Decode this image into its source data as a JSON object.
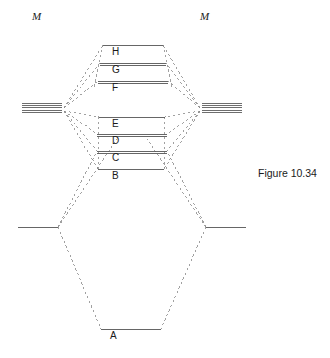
{
  "figure": {
    "caption": "Figure 10.34",
    "caption_x": 258,
    "caption_y": 167,
    "width": 330,
    "height": 358,
    "background_color": "#ffffff",
    "line_color": "#555555",
    "dash_color": "#8a8a8a",
    "text_color": "#1a1a1a"
  },
  "atoms": {
    "left": {
      "label": "M",
      "label_x": 32,
      "label_y": 10,
      "ao_bundle": {
        "x_start": 22,
        "x_end": 62,
        "y_top": 103,
        "line_count": 5,
        "line_spacing": 2.4
      },
      "ligand_level": {
        "x_start": 18,
        "x_end": 58,
        "y": 227
      }
    },
    "right": {
      "label": "M",
      "label_x": 200,
      "label_y": 10,
      "ao_bundle": {
        "x_start": 202,
        "x_end": 242,
        "y_top": 103,
        "line_count": 5,
        "line_spacing": 2.4
      },
      "ligand_level": {
        "x_start": 206,
        "x_end": 246,
        "y": 227
      }
    }
  },
  "molecular_orbitals": [
    {
      "id": "H",
      "label": "H",
      "y": 45,
      "x_start": 103,
      "x_end": 163,
      "lines": 1,
      "label_x": 112,
      "label_y": 47
    },
    {
      "id": "G",
      "label": "G",
      "y": 63,
      "x_start": 100,
      "x_end": 166,
      "lines": 2,
      "label_x": 112,
      "label_y": 65
    },
    {
      "id": "F",
      "label": "F",
      "y": 81,
      "x_start": 98,
      "x_end": 168,
      "lines": 2,
      "label_x": 112,
      "label_y": 83
    },
    {
      "id": "E",
      "label": "E",
      "y": 117,
      "x_start": 99,
      "x_end": 165,
      "lines": 1,
      "label_x": 112,
      "label_y": 119
    },
    {
      "id": "D",
      "label": "D",
      "y": 134,
      "x_start": 97,
      "x_end": 167,
      "lines": 2,
      "label_x": 112,
      "label_y": 136
    },
    {
      "id": "C",
      "label": "C",
      "y": 151,
      "x_start": 97,
      "x_end": 167,
      "lines": 2,
      "label_x": 112,
      "label_y": 153
    },
    {
      "id": "B",
      "label": "B",
      "y": 169,
      "x_start": 98,
      "x_end": 164,
      "lines": 1,
      "label_x": 112,
      "label_y": 171
    },
    {
      "id": "A",
      "label": "A",
      "y": 329,
      "x_start": 101,
      "x_end": 161,
      "lines": 1,
      "label_x": 110,
      "label_y": 331
    }
  ],
  "connectors": {
    "left_ao_node_x": 64,
    "left_ao_node_y": 108,
    "right_ao_node_x": 200,
    "right_ao_node_y": 108,
    "left_ligand_node_x": 58,
    "left_ligand_node_y": 227,
    "right_ligand_node_x": 206,
    "right_ligand_node_y": 227,
    "dash_pattern": "2.5,2.5"
  }
}
